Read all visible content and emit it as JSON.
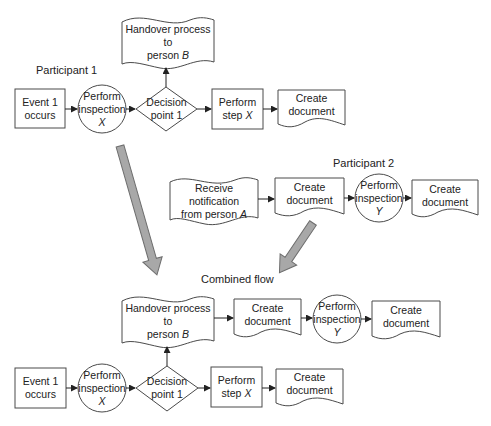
{
  "titles": {
    "participant1": "Participant 1",
    "participant2": "Participant 2",
    "combined": "Combined flow"
  },
  "participant1": {
    "handover": {
      "line1": "Handover process to",
      "line2a": "person ",
      "line2b": "B"
    },
    "event": {
      "line1": "Event 1",
      "line2": "occurs"
    },
    "inspection": {
      "line1": "Perform",
      "line2": "inspection",
      "line3": "X"
    },
    "decision": {
      "line1": "Decision",
      "line2": "point 1"
    },
    "step": {
      "line1": "Perform",
      "line2a": "step ",
      "line2b": "X"
    },
    "document": {
      "line1": "Create",
      "line2": "document"
    }
  },
  "participant2": {
    "receive": {
      "line1": "Receive notification",
      "line2a": "from person ",
      "line2b": "A"
    },
    "document1": {
      "line1": "Create",
      "line2": "document"
    },
    "inspection": {
      "line1": "Perform",
      "line2": "inspection",
      "line3": "Y"
    },
    "document2": {
      "line1": "Create",
      "line2": "document"
    }
  },
  "combined": {
    "handover": {
      "line1": "Handover process to",
      "line2a": "person ",
      "line2b": "B"
    },
    "document1": {
      "line1": "Create",
      "line2": "document"
    },
    "inspectionY": {
      "line1": "Perform",
      "line2": "inspection",
      "line3": "Y"
    },
    "document2": {
      "line1": "Create",
      "line2": "document"
    },
    "event": {
      "line1": "Event 1",
      "line2": "occurs"
    },
    "inspectionX": {
      "line1": "Perform",
      "line2": "inspection",
      "line3": "X"
    },
    "decision": {
      "line1": "Decision",
      "line2": "point 1"
    },
    "step": {
      "line1": "Perform",
      "line2a": "step ",
      "line2b": "X"
    },
    "document3": {
      "line1": "Create",
      "line2": "document"
    }
  },
  "colors": {
    "stroke": "#4a4a4a",
    "merge_arrow_fill": "#a8a8a8",
    "background": "#ffffff"
  }
}
